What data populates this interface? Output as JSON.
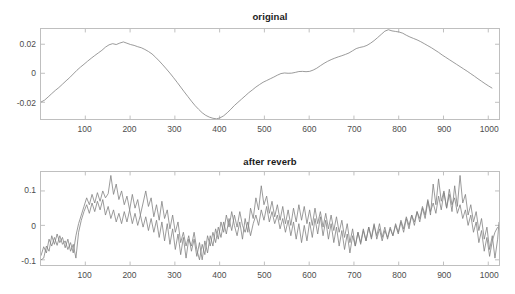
{
  "figure": {
    "background": "#ffffff",
    "axis_color": "#bfbfbf",
    "tick_label_color": "#4d4d4d",
    "title_color": "#1b1b1b",
    "line_color": "#808080"
  },
  "chart_data": [
    {
      "type": "line",
      "name": "original",
      "title": "original",
      "xlabel": "",
      "ylabel": "",
      "xlim": [
        1,
        1024
      ],
      "ylim": [
        -0.0315,
        0.0305
      ],
      "grid": false,
      "legend": null,
      "xticks": [
        100,
        200,
        300,
        400,
        500,
        600,
        700,
        800,
        900,
        1000
      ],
      "xticklabels": [
        "100",
        "200",
        "300",
        "400",
        "500",
        "600",
        "700",
        "800",
        "900",
        "1000"
      ],
      "yticks": [
        0.02,
        0,
        -0.02
      ],
      "yticklabels": [
        "0.02",
        "0",
        "-0.02"
      ],
      "series": [
        {
          "name": "original signal",
          "color": "#808080",
          "x": [
            1,
            9,
            17,
            25,
            33,
            41,
            49,
            57,
            65,
            73,
            81,
            89,
            97,
            105,
            113,
            121,
            129,
            137,
            145,
            153,
            161,
            169,
            177,
            185,
            193,
            201,
            209,
            217,
            225,
            233,
            241,
            249,
            257,
            265,
            273,
            281,
            289,
            297,
            305,
            313,
            321,
            329,
            337,
            345,
            353,
            361,
            369,
            377,
            385,
            393,
            401,
            409,
            417,
            425,
            433,
            441,
            449,
            457,
            465,
            473,
            481,
            489,
            497,
            505,
            513,
            521,
            529,
            537,
            545,
            553,
            561,
            569,
            577,
            585,
            593,
            601,
            609,
            617,
            625,
            633,
            641,
            649,
            657,
            665,
            673,
            681,
            689,
            697,
            705,
            713,
            721,
            729,
            737,
            745,
            753,
            761,
            769,
            777,
            785,
            793,
            801,
            809,
            817,
            825,
            833,
            841,
            849,
            857,
            865,
            873,
            881,
            889,
            897,
            905,
            913,
            921,
            929,
            937,
            945,
            953,
            961,
            969,
            977,
            985,
            993,
            1001,
            1009,
            1017,
            1024
          ],
          "y": [
            -0.0198,
            -0.0185,
            -0.0163,
            -0.014,
            -0.0118,
            -0.0098,
            -0.0075,
            -0.0052,
            -0.003,
            -0.0005,
            0.002,
            0.0042,
            0.0062,
            0.0083,
            0.0103,
            0.0122,
            0.014,
            0.0158,
            0.018,
            0.0196,
            0.0204,
            0.0198,
            0.0208,
            0.0216,
            0.0207,
            0.0198,
            0.0192,
            0.0183,
            0.0176,
            0.0164,
            0.015,
            0.0133,
            0.011,
            0.0085,
            0.0058,
            0.003,
            0.0001,
            -0.003,
            -0.0062,
            -0.0095,
            -0.0128,
            -0.016,
            -0.0192,
            -0.0222,
            -0.0248,
            -0.0272,
            -0.029,
            -0.0302,
            -0.031,
            -0.0314,
            -0.0307,
            -0.0293,
            -0.0272,
            -0.0248,
            -0.0222,
            -0.02,
            -0.0178,
            -0.0156,
            -0.0134,
            -0.0115,
            -0.0095,
            -0.0078,
            -0.0062,
            -0.005,
            -0.0038,
            -0.0026,
            -0.0013,
            -0.0002,
            0.0002,
            0.0,
            0.0001,
            0.0006,
            0.0012,
            0.0013,
            0.0011,
            0.0013,
            0.0022,
            0.0035,
            0.0052,
            0.0068,
            0.0082,
            0.0094,
            0.0104,
            0.0113,
            0.0121,
            0.013,
            0.014,
            0.0155,
            0.017,
            0.0178,
            0.0183,
            0.0192,
            0.0207,
            0.0225,
            0.0246,
            0.0268,
            0.029,
            0.03,
            0.0292,
            0.0288,
            0.0284,
            0.0276,
            0.0262,
            0.025,
            0.024,
            0.023,
            0.0218,
            0.0204,
            0.019,
            0.0176,
            0.016,
            0.0144,
            0.0126,
            0.011,
            0.0094,
            0.0078,
            0.0062,
            0.0046,
            0.003,
            0.0014,
            -0.0003,
            -0.002,
            -0.0038,
            -0.0055,
            -0.0072,
            -0.0088,
            -0.0103
          ]
        }
      ]
    },
    {
      "type": "line",
      "name": "after reverb",
      "title": "after reverb",
      "xlabel": "",
      "ylabel": "",
      "xlim": [
        1,
        1024
      ],
      "ylim": [
        -0.115,
        0.155
      ],
      "grid": false,
      "legend": null,
      "xticks": [
        100,
        200,
        300,
        400,
        500,
        600,
        700,
        800,
        900,
        1000
      ],
      "xticklabels": [
        "100",
        "200",
        "300",
        "400",
        "500",
        "600",
        "700",
        "800",
        "900",
        "1000"
      ],
      "yticks": [
        0.1,
        0,
        -0.1
      ],
      "yticklabels": [
        "0.1",
        "0",
        "-0.1"
      ],
      "series": [
        {
          "name": "reverb channel 1",
          "color": "#808080",
          "x": [
            1,
            7,
            13,
            19,
            25,
            31,
            37,
            43,
            49,
            55,
            61,
            67,
            73,
            79,
            85,
            91,
            97,
            103,
            109,
            115,
            121,
            127,
            133,
            139,
            145,
            151,
            157,
            163,
            169,
            175,
            181,
            187,
            193,
            199,
            205,
            211,
            217,
            223,
            229,
            235,
            241,
            247,
            253,
            259,
            265,
            271,
            277,
            283,
            289,
            295,
            301,
            307,
            313,
            319,
            325,
            331,
            337,
            343,
            349,
            355,
            361,
            367,
            373,
            379,
            385,
            391,
            397,
            403,
            409,
            415,
            421,
            427,
            433,
            439,
            445,
            451,
            457,
            463,
            469,
            475,
            481,
            487,
            493,
            499,
            505,
            511,
            517,
            523,
            529,
            535,
            541,
            547,
            553,
            559,
            565,
            571,
            577,
            583,
            589,
            595,
            601,
            607,
            613,
            619,
            625,
            631,
            637,
            643,
            649,
            655,
            661,
            667,
            673,
            679,
            685,
            691,
            697,
            703,
            709,
            715,
            721,
            727,
            733,
            739,
            745,
            751,
            757,
            763,
            769,
            775,
            781,
            787,
            793,
            799,
            805,
            811,
            817,
            823,
            829,
            835,
            841,
            847,
            853,
            859,
            865,
            871,
            877,
            883,
            889,
            895,
            901,
            907,
            913,
            919,
            925,
            931,
            937,
            943,
            949,
            955,
            961,
            967,
            973,
            979,
            985,
            991,
            997,
            1003,
            1009,
            1015,
            1021,
            1024
          ],
          "y": [
            -0.088,
            -0.062,
            -0.08,
            -0.04,
            -0.06,
            -0.035,
            -0.058,
            -0.03,
            -0.055,
            -0.045,
            -0.07,
            -0.05,
            -0.08,
            -0.03,
            0.005,
            0.03,
            0.055,
            0.08,
            0.06,
            0.09,
            0.065,
            0.095,
            0.07,
            0.1,
            0.08,
            0.092,
            0.145,
            0.09,
            0.12,
            0.075,
            0.1,
            0.06,
            0.085,
            0.045,
            0.09,
            0.05,
            0.075,
            0.03,
            0.065,
            0.1,
            0.055,
            0.08,
            0.025,
            0.06,
            0.015,
            0.07,
            0.02,
            0.045,
            -0.01,
            0.03,
            -0.02,
            0.01,
            -0.05,
            -0.02,
            -0.06,
            -0.03,
            -0.075,
            -0.04,
            -0.09,
            -0.05,
            -0.1,
            -0.045,
            -0.08,
            -0.03,
            -0.06,
            -0.01,
            -0.04,
            0.01,
            -0.02,
            0.03,
            -0.005,
            0.04,
            0.0,
            -0.03,
            0.01,
            -0.04,
            0.02,
            -0.02,
            0.05,
            0.02,
            0.08,
            0.045,
            0.115,
            0.06,
            0.085,
            0.035,
            0.07,
            0.025,
            0.06,
            0.015,
            0.055,
            0.005,
            0.045,
            0.0,
            0.05,
            0.01,
            0.06,
            0.015,
            0.055,
            0.005,
            0.045,
            0.0,
            0.05,
            0.005,
            0.04,
            -0.005,
            0.035,
            -0.01,
            0.03,
            -0.015,
            0.025,
            -0.02,
            0.015,
            -0.035,
            0.005,
            -0.05,
            -0.01,
            -0.06,
            -0.02,
            -0.055,
            -0.015,
            -0.045,
            -0.005,
            -0.04,
            0.0,
            -0.03,
            0.005,
            -0.035,
            -0.005,
            -0.04,
            -0.01,
            -0.03,
            0.0,
            -0.025,
            0.01,
            -0.02,
            0.02,
            -0.01,
            0.03,
            0.0,
            0.04,
            0.01,
            0.05,
            0.02,
            0.07,
            0.03,
            0.12,
            0.06,
            0.135,
            0.07,
            0.1,
            0.05,
            0.09,
            0.04,
            0.115,
            0.055,
            0.145,
            0.065,
            0.09,
            0.03,
            0.06,
            0.01,
            0.04,
            -0.015,
            0.02,
            -0.04,
            -0.005,
            -0.07,
            -0.03,
            -0.095,
            -0.04,
            0.01,
            0.02
          ]
        },
        {
          "name": "reverb channel 2",
          "color": "#808080",
          "x": [
            1,
            7,
            13,
            19,
            25,
            31,
            37,
            43,
            49,
            55,
            61,
            67,
            73,
            79,
            85,
            91,
            97,
            103,
            109,
            115,
            121,
            127,
            133,
            139,
            145,
            151,
            157,
            163,
            169,
            175,
            181,
            187,
            193,
            199,
            205,
            211,
            217,
            223,
            229,
            235,
            241,
            247,
            253,
            259,
            265,
            271,
            277,
            283,
            289,
            295,
            301,
            307,
            313,
            319,
            325,
            331,
            337,
            343,
            349,
            355,
            361,
            367,
            373,
            379,
            385,
            391,
            397,
            403,
            409,
            415,
            421,
            427,
            433,
            439,
            445,
            451,
            457,
            463,
            469,
            475,
            481,
            487,
            493,
            499,
            505,
            511,
            517,
            523,
            529,
            535,
            541,
            547,
            553,
            559,
            565,
            571,
            577,
            583,
            589,
            595,
            601,
            607,
            613,
            619,
            625,
            631,
            637,
            643,
            649,
            655,
            661,
            667,
            673,
            679,
            685,
            691,
            697,
            703,
            709,
            715,
            721,
            727,
            733,
            739,
            745,
            751,
            757,
            763,
            769,
            775,
            781,
            787,
            793,
            799,
            805,
            811,
            817,
            823,
            829,
            835,
            841,
            847,
            853,
            859,
            865,
            871,
            877,
            883,
            889,
            895,
            901,
            907,
            913,
            919,
            925,
            931,
            937,
            943,
            949,
            955,
            961,
            967,
            973,
            979,
            985,
            991,
            997,
            1003,
            1009,
            1015,
            1021,
            1024
          ],
          "y": [
            -0.1,
            -0.095,
            -0.06,
            -0.075,
            -0.03,
            -0.055,
            -0.025,
            -0.05,
            -0.035,
            -0.065,
            -0.04,
            -0.075,
            -0.055,
            -0.095,
            -0.02,
            0.015,
            0.04,
            0.06,
            0.035,
            0.065,
            0.04,
            0.07,
            0.045,
            0.075,
            0.03,
            0.055,
            0.02,
            0.045,
            0.01,
            0.035,
            0.005,
            0.04,
            0.01,
            0.045,
            0.005,
            0.035,
            0.0,
            0.03,
            -0.005,
            0.025,
            -0.015,
            0.02,
            -0.02,
            0.015,
            -0.035,
            0.01,
            -0.045,
            0.005,
            -0.055,
            -0.01,
            -0.07,
            -0.025,
            -0.085,
            -0.035,
            -0.095,
            -0.04,
            -0.06,
            -0.02,
            -0.07,
            -0.1,
            -0.055,
            -0.085,
            -0.03,
            -0.06,
            -0.02,
            -0.05,
            -0.005,
            -0.035,
            0.01,
            -0.025,
            0.02,
            -0.015,
            0.03,
            -0.005,
            0.04,
            0.0,
            -0.02,
            0.01,
            -0.03,
            0.005,
            0.03,
            0.0,
            0.045,
            0.015,
            0.055,
            0.01,
            0.04,
            0.005,
            0.03,
            -0.01,
            0.02,
            -0.02,
            0.015,
            -0.03,
            0.01,
            -0.04,
            0.005,
            -0.05,
            0.0,
            -0.045,
            0.01,
            -0.035,
            0.02,
            -0.025,
            0.025,
            -0.03,
            0.015,
            -0.04,
            0.005,
            -0.05,
            -0.005,
            -0.06,
            -0.015,
            -0.07,
            -0.025,
            -0.08,
            -0.03,
            -0.06,
            -0.02,
            -0.05,
            -0.01,
            -0.045,
            -0.005,
            -0.035,
            0.005,
            -0.04,
            -0.01,
            -0.045,
            -0.015,
            -0.035,
            -0.005,
            -0.03,
            0.005,
            -0.02,
            0.015,
            -0.01,
            0.025,
            0.0,
            0.03,
            0.01,
            0.04,
            0.02,
            0.055,
            0.03,
            0.075,
            0.04,
            0.065,
            0.035,
            0.085,
            0.045,
            0.095,
            0.05,
            0.105,
            0.06,
            0.08,
            0.035,
            0.06,
            0.02,
            0.045,
            0.0,
            0.03,
            -0.02,
            0.01,
            -0.05,
            -0.015,
            -0.075,
            -0.035,
            -0.09,
            -0.045,
            -0.02,
            -0.005
          ]
        }
      ]
    }
  ]
}
